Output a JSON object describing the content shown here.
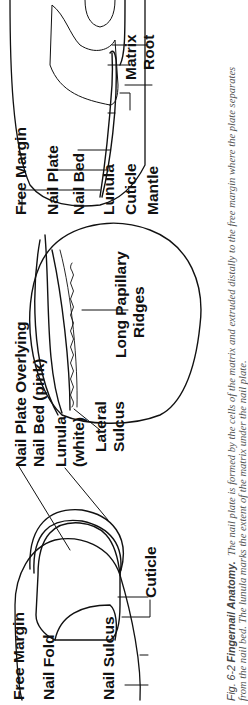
{
  "figure": {
    "number": "Fig. 6-2",
    "title": "Fingernail Anatomy.",
    "caption_line1": "The nail plate is formed by the cells of the matrix and extruded distally to the free margin where the plate separates",
    "caption_line2": "from the nail bed. The lunula marks the extent of the matrix under the nail plate.",
    "orientation": "rotated 90° counter-clockwise"
  },
  "panels": {
    "top_view": {
      "labels": {
        "free_margin": "Free Margin",
        "nail_fold": "Nail Fold",
        "nail_sulcus": "Nail Sulcus",
        "cuticle": "Cuticle",
        "nail_plate_overlying": "Nail Plate Overlying",
        "nail_bed_pink": "Nail Bed (pink)",
        "lunula": "Lunula",
        "lunula_white": "(white)"
      }
    },
    "cross_section": {
      "labels": {
        "lateral": "Lateral",
        "sulcus": "Sulcus",
        "long_papillary": "Long Papillary",
        "ridges": "Ridges"
      }
    },
    "side_view": {
      "labels": {
        "free_margin": "Free Margin",
        "nail_plate": "Nail Plate",
        "nail_bed": "Nail Bed",
        "lunula": "Lunula",
        "cuticle": "Cuticle",
        "mantle": "Mantle",
        "matrix": "Matrix",
        "root": "Root"
      }
    }
  },
  "colors": {
    "ink": "#111111",
    "caption": "#555555",
    "background": "#ffffff"
  }
}
